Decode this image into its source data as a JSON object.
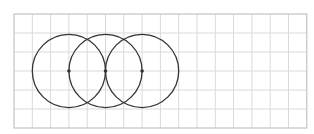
{
  "diagram": {
    "grid": {
      "x": 14,
      "y": 14,
      "columns": 16,
      "rows": 6,
      "cell_width": 18.3,
      "cell_height": 19,
      "line_color": "#d9d9d9",
      "border_color": "#c4c4c4"
    },
    "circles": [
      {
        "name": "circle-left",
        "cx_cell": 3,
        "cy_cell": 3,
        "r_cells": 2
      },
      {
        "name": "circle-middle",
        "cx_cell": 5,
        "cy_cell": 3,
        "r_cells": 2
      },
      {
        "name": "circle-right",
        "cx_cell": 7,
        "cy_cell": 3,
        "r_cells": 2
      }
    ],
    "center_points": [
      {
        "name": "center-point-left",
        "cx_cell": 3,
        "cy_cell": 3
      },
      {
        "name": "center-point-middle",
        "cx_cell": 5,
        "cy_cell": 3
      },
      {
        "name": "center-point-right",
        "cx_cell": 7,
        "cy_cell": 3
      }
    ],
    "stroke_color": "#333333",
    "stroke_width": 1.3,
    "point_radius": 1.8
  }
}
